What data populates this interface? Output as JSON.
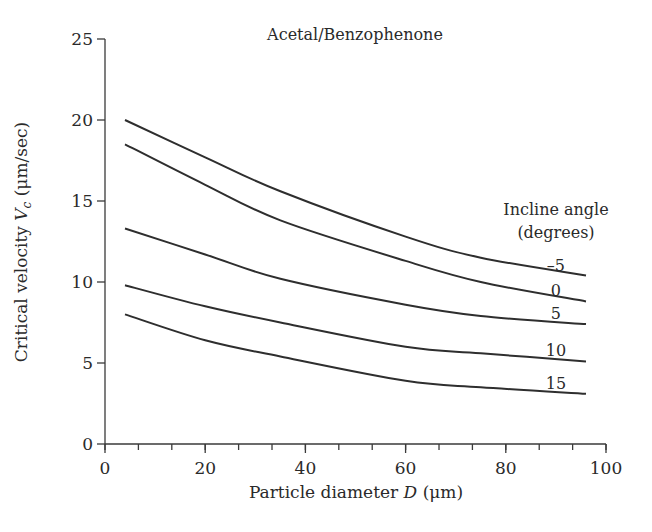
{
  "chart_data": {
    "type": "line",
    "title": "Acetal/Benzophenone",
    "xlabel": "Particle diameter D (μm)",
    "xlabel_parts": {
      "prefix": "Particle diameter ",
      "var": "D",
      "suffix": " (μm)"
    },
    "ylabel": "Critical velocity Vc (μm/sec)",
    "ylabel_parts": {
      "prefix": "Critical velocity ",
      "var": "V",
      "sub": "c",
      "suffix": " (μm/sec)"
    },
    "xlim": [
      0,
      100
    ],
    "ylim": [
      0,
      25
    ],
    "xticks": [
      0,
      20,
      40,
      60,
      80,
      100
    ],
    "xminor_step": 6.667,
    "yticks": [
      0,
      5,
      10,
      15,
      20,
      25
    ],
    "grid": false,
    "legend": {
      "title_line1": "Incline angle",
      "title_line2": "(degrees)",
      "position": "right, inline labels at curve ends"
    },
    "x": [
      4,
      20,
      35,
      60,
      75,
      96
    ],
    "series": [
      {
        "name": "-5",
        "label": "–5",
        "values": [
          20.0,
          17.7,
          15.6,
          12.8,
          11.5,
          10.4
        ]
      },
      {
        "name": "0",
        "label": "0",
        "values": [
          18.5,
          16.0,
          13.8,
          11.3,
          10.0,
          8.8
        ]
      },
      {
        "name": "5",
        "label": "5",
        "values": [
          13.3,
          11.7,
          10.2,
          8.6,
          7.9,
          7.4
        ]
      },
      {
        "name": "10",
        "label": "10",
        "values": [
          9.8,
          8.5,
          7.5,
          6.0,
          5.6,
          5.1
        ]
      },
      {
        "name": "15",
        "label": "15",
        "values": [
          8.0,
          6.4,
          5.4,
          3.9,
          3.5,
          3.1
        ]
      }
    ]
  }
}
